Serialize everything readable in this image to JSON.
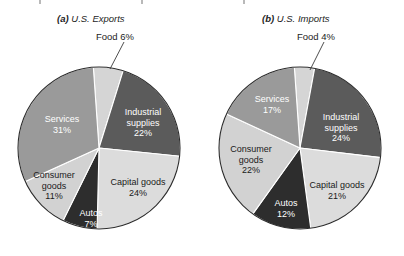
{
  "figure": {
    "background_color": "#ffffff",
    "panels": [
      {
        "id": "exports",
        "tag": "(a)",
        "title": "U.S. Exports",
        "caption_full": "(a) U.S. Exports",
        "callout": {
          "label": "Food 6%",
          "name": "Food",
          "value": 6
        }
      },
      {
        "id": "imports",
        "tag": "(b)",
        "title": "U.S. Imports",
        "caption_full": "(b) U.S. Imports",
        "callout": {
          "label": "Food 4%",
          "name": "Food",
          "value": 4
        }
      }
    ]
  },
  "colors": {
    "food": "#d5d5d5",
    "industrial_supplies": "#5b5b5b",
    "capital_goods": "#dcdcdc",
    "autos": "#2d2d2d",
    "consumer_goods": "#d2d2d2",
    "services": "#9a9a9a",
    "outline": "#2b2b2b",
    "slice_divider": "#ffffff",
    "text_dark": "#1a1a1a",
    "text_light": "#ffffff"
  },
  "chart_data": [
    {
      "type": "pie",
      "id": "exports",
      "title": "(a) U.S. Exports",
      "subtitle": "U.S. Exports",
      "units": "percent",
      "legend": "none",
      "labels_inside": true,
      "categories": [
        "Food",
        "Industrial supplies",
        "Capital goods",
        "Autos",
        "Consumer goods",
        "Services"
      ],
      "values": [
        6,
        22,
        24,
        7,
        11,
        31
      ],
      "slices": [
        {
          "name": "Food",
          "value": 6,
          "label": "Food 6%",
          "pct_text": "6%",
          "color": "#d5d5d5",
          "text_color": "#1a1a1a",
          "placement": "outside"
        },
        {
          "name": "Industrial supplies",
          "value": 22,
          "label": "Industrial supplies",
          "pct_text": "22%",
          "color": "#5b5b5b",
          "text_color": "#ffffff",
          "placement": "inside"
        },
        {
          "name": "Capital goods",
          "value": 24,
          "label": "Capital goods",
          "pct_text": "24%",
          "color": "#dcdcdc",
          "text_color": "#1a1a1a",
          "placement": "inside"
        },
        {
          "name": "Autos",
          "value": 7,
          "label": "Autos",
          "pct_text": "7%",
          "color": "#2d2d2d",
          "text_color": "#ffffff",
          "placement": "inside"
        },
        {
          "name": "Consumer goods",
          "value": 11,
          "label": "Consumer goods",
          "pct_text": "11%",
          "color": "#d2d2d2",
          "text_color": "#1a1a1a",
          "placement": "inside"
        },
        {
          "name": "Services",
          "value": 31,
          "label": "Services",
          "pct_text": "31%",
          "color": "#9a9a9a",
          "text_color": "#ffffff",
          "placement": "inside"
        }
      ]
    },
    {
      "type": "pie",
      "id": "imports",
      "title": "(b) U.S. Imports",
      "subtitle": "U.S. Imports",
      "units": "percent",
      "legend": "none",
      "labels_inside": true,
      "categories": [
        "Food",
        "Industrial supplies",
        "Capital goods",
        "Autos",
        "Consumer goods",
        "Services"
      ],
      "values": [
        4,
        24,
        21,
        12,
        22,
        17
      ],
      "slices": [
        {
          "name": "Food",
          "value": 4,
          "label": "Food 4%",
          "pct_text": "4%",
          "color": "#d5d5d5",
          "text_color": "#1a1a1a",
          "placement": "outside"
        },
        {
          "name": "Industrial supplies",
          "value": 24,
          "label": "Industrial supplies",
          "pct_text": "24%",
          "color": "#5b5b5b",
          "text_color": "#ffffff",
          "placement": "inside"
        },
        {
          "name": "Capital goods",
          "value": 21,
          "label": "Capital goods",
          "pct_text": "21%",
          "color": "#dcdcdc",
          "text_color": "#1a1a1a",
          "placement": "inside"
        },
        {
          "name": "Autos",
          "value": 12,
          "label": "Autos",
          "pct_text": "12%",
          "color": "#2d2d2d",
          "text_color": "#ffffff",
          "placement": "inside"
        },
        {
          "name": "Consumer goods",
          "value": 22,
          "label": "Consumer goods",
          "pct_text": "22%",
          "color": "#d2d2d2",
          "text_color": "#1a1a1a",
          "placement": "inside"
        },
        {
          "name": "Services",
          "value": 17,
          "label": "Services",
          "pct_text": "17%",
          "color": "#9a9a9a",
          "text_color": "#ffffff",
          "placement": "inside"
        }
      ]
    }
  ],
  "labels": {
    "exports": {
      "industrial_supplies_name": "Industrial",
      "industrial_supplies_name2": "supplies",
      "industrial_supplies_pct": "22%",
      "capital_goods_name": "Capital goods",
      "capital_goods_pct": "24%",
      "autos_name": "Autos",
      "autos_pct": "7%",
      "consumer_goods_name": "Consumer",
      "consumer_goods_name2": "goods",
      "consumer_goods_pct": "11%",
      "services_name": "Services",
      "services_pct": "31%"
    },
    "imports": {
      "industrial_supplies_name": "Industrial",
      "industrial_supplies_name2": "supplies",
      "industrial_supplies_pct": "24%",
      "capital_goods_name": "Capital goods",
      "capital_goods_pct": "21%",
      "autos_name": "Autos",
      "autos_pct": "12%",
      "consumer_goods_name": "Consumer",
      "consumer_goods_name2": "goods",
      "consumer_goods_pct": "22%",
      "services_name": "Services",
      "services_pct": "17%"
    }
  }
}
